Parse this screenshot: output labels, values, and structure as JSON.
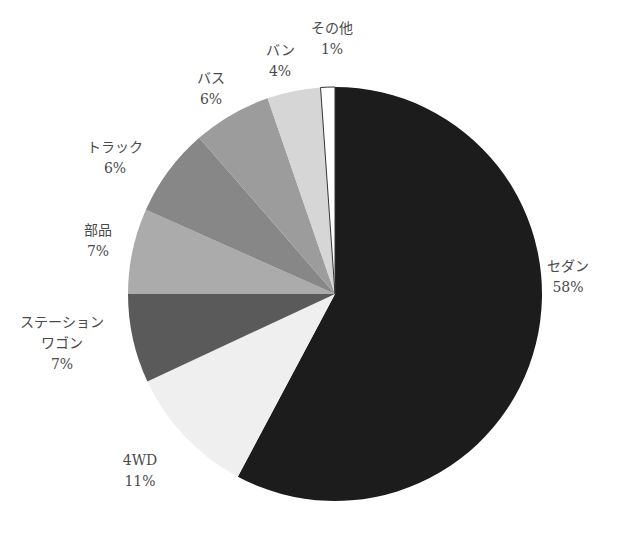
{
  "chart_data": {
    "type": "pie",
    "title": "",
    "start_angle_deg": 0,
    "direction": "clockwise",
    "categories": [
      "セダン",
      "4WD",
      "ステーションワゴン",
      "部品",
      "トラック",
      "バス",
      "バン",
      "その他"
    ],
    "values": [
      58,
      11,
      7,
      7,
      6,
      6,
      4,
      1
    ],
    "unit": "%",
    "slices": [
      {
        "name": "セダン",
        "value": 58,
        "label_lines": [
          "セダン",
          "58%"
        ],
        "color": "#1c1c1c",
        "start": 0,
        "end": 208
      },
      {
        "name": "4WD",
        "value": 11,
        "label_lines": [
          "4WD",
          "11%"
        ],
        "color": "#efefef",
        "start": 208,
        "end": 245
      },
      {
        "name": "ステーションワゴン",
        "value": 7,
        "label_lines": [
          "ステーション",
          "ワゴン",
          "7%"
        ],
        "color": "#5a5a5a",
        "start": 245,
        "end": 270
      },
      {
        "name": "部品",
        "value": 7,
        "label_lines": [
          "部品",
          "7%"
        ],
        "color": "#ababab",
        "start": 270,
        "end": 294
      },
      {
        "name": "トラック",
        "value": 6,
        "label_lines": [
          "トラック",
          "6%"
        ],
        "color": "#878787",
        "start": 294,
        "end": 319
      },
      {
        "name": "バス",
        "value": 6,
        "label_lines": [
          "バス",
          "6%"
        ],
        "color": "#9c9c9c",
        "start": 319,
        "end": 341
      },
      {
        "name": "バン",
        "value": 4,
        "label_lines": [
          "バン",
          "4%"
        ],
        "color": "#d6d6d6",
        "start": 341,
        "end": 356
      },
      {
        "name": "その他",
        "value": 1,
        "label_lines": [
          "その他",
          "1%"
        ],
        "color": "#ffffff",
        "start": 356,
        "end": 360
      }
    ],
    "legend": "none (labels placed outside slices)"
  },
  "layout": {
    "center": [
      335,
      294
    ],
    "radius": 207,
    "labels": [
      {
        "x": 568,
        "y": 256
      },
      {
        "x": 140,
        "y": 450
      },
      {
        "x": 62,
        "y": 312
      },
      {
        "x": 98,
        "y": 220
      },
      {
        "x": 115,
        "y": 137
      },
      {
        "x": 211,
        "y": 68
      },
      {
        "x": 280,
        "y": 40
      },
      {
        "x": 332,
        "y": 18
      }
    ]
  }
}
